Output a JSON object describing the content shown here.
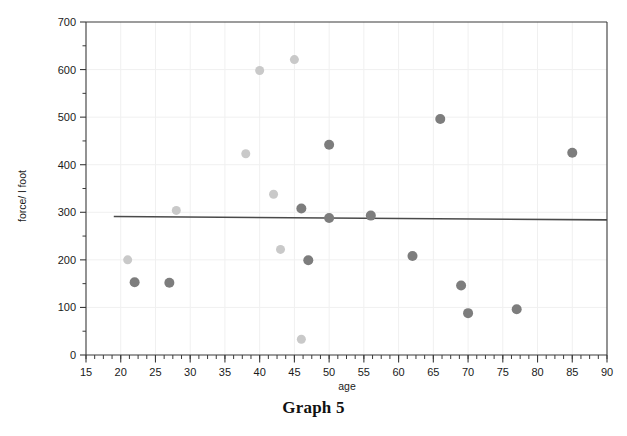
{
  "caption": "Graph 5",
  "chart_data": {
    "type": "scatter",
    "title": "Graph 5",
    "xlabel": "age",
    "ylabel": "force/ l foot",
    "xlim": [
      15,
      90
    ],
    "ylim": [
      0,
      700
    ],
    "xticks": [
      15,
      20,
      25,
      30,
      35,
      40,
      45,
      50,
      55,
      60,
      65,
      70,
      75,
      80,
      85,
      90
    ],
    "yticks": [
      0,
      100,
      200,
      300,
      400,
      500,
      600,
      700
    ],
    "xtick_labels": [
      "15",
      "20",
      "25",
      "30",
      "35",
      "40",
      "45",
      "50",
      "55",
      "60",
      "65",
      "70",
      "75",
      "80",
      "85",
      "90"
    ],
    "ytick_labels": [
      "0",
      "100",
      "200",
      "300",
      "400",
      "500",
      "600",
      "700"
    ],
    "x_minor_tick_step": 1.25,
    "y_minor_tick_step": 50,
    "grid": true,
    "legend": "none",
    "series": [
      {
        "name": "light-group",
        "color": "#c9c9c9",
        "marker": "circle",
        "marker_size": 9,
        "points": [
          {
            "x": 21,
            "y": 200
          },
          {
            "x": 28,
            "y": 304
          },
          {
            "x": 38,
            "y": 423
          },
          {
            "x": 40,
            "y": 598
          },
          {
            "x": 42,
            "y": 338
          },
          {
            "x": 43,
            "y": 222
          },
          {
            "x": 45,
            "y": 621
          },
          {
            "x": 46,
            "y": 33
          }
        ]
      },
      {
        "name": "dark-group",
        "color": "#7d7d7d",
        "marker": "circle",
        "marker_size": 10,
        "points": [
          {
            "x": 22,
            "y": 153
          },
          {
            "x": 27,
            "y": 152
          },
          {
            "x": 46,
            "y": 308
          },
          {
            "x": 47,
            "y": 199
          },
          {
            "x": 50,
            "y": 288
          },
          {
            "x": 50,
            "y": 442
          },
          {
            "x": 56,
            "y": 293
          },
          {
            "x": 62,
            "y": 208
          },
          {
            "x": 66,
            "y": 496
          },
          {
            "x": 69,
            "y": 146
          },
          {
            "x": 70,
            "y": 88
          },
          {
            "x": 77,
            "y": 96
          },
          {
            "x": 85,
            "y": 425
          }
        ]
      }
    ],
    "trendline": {
      "name": "linear-fit",
      "color": "#4a4a4a",
      "x_start": 19,
      "y_start": 291,
      "x_end": 90,
      "y_end": 284
    },
    "colors": {
      "axis": "#3a3a3a",
      "grid": "#f0f0f0",
      "text": "#1a1a1a",
      "light_marker": "#c9c9c9",
      "dark_marker": "#7d7d7d",
      "trendline": "#4a4a4a",
      "background": "#ffffff"
    }
  }
}
